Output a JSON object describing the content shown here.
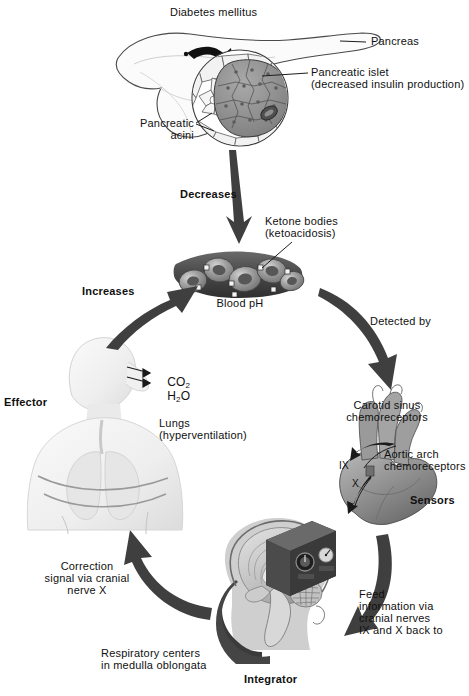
{
  "figure": {
    "background_color": "#ffffff",
    "text_color": "#101010",
    "arrow_color": "#3a3a3a"
  },
  "labels": {
    "diabetes_mellitus": "Diabetes mellitus",
    "pancreas": "Pancreas",
    "pancreatic_islet_line1": "Pancreatic islet",
    "pancreatic_islet_line2": "(decreased insulin production)",
    "pancreatic_acini_line1": "Pancreatic",
    "pancreatic_acini_line2": "acini",
    "decreases": "Decreases",
    "ketone_bodies_line1": "Ketone bodies",
    "ketone_bodies_line2": "(ketoacidosis)",
    "blood_ph": "Blood pH",
    "detected_by": "Detected by",
    "carotid_line1": "Carotid sinus",
    "carotid_line2": "chemoreceptors",
    "aortic_line1": "Aortic arch",
    "aortic_line2": "chemoreceptors",
    "sensors": "Sensors",
    "nerve_ix": "IX",
    "nerve_x": "X",
    "feed_line1": "Feed",
    "feed_line2": "information via",
    "feed_line3": "cranial nerves",
    "feed_line4": "IX and X back to",
    "integrator": "Integrator",
    "respiratory_line1": "Respiratory centers",
    "respiratory_line2": "in medulla oblongata",
    "correction_line1": "Correction",
    "correction_line2": "signal via cranial",
    "correction_line3": "nerve X",
    "increases": "Increases",
    "effector": "Effector",
    "lungs_line1": "Lungs",
    "lungs_line2": "(hyperventilation)",
    "co2_formula": "CO",
    "co2_sub": "2",
    "h2o_formula_h": "H",
    "h2o_sub": "2",
    "h2o_formula_o": "O"
  },
  "loop_steps": [
    "Diabetes mellitus / pancreatic islet with decreased insulin production",
    "Decreases blood pH (ketone bodies / ketoacidosis)",
    "Detected by carotid sinus and aortic arch chemoreceptors (Sensors)",
    "Feed information via cranial nerves IX and X back to respiratory centers in medulla oblongata (Integrator)",
    "Correction signal via cranial nerve X to lungs (Effector)",
    "Lungs hyperventilate expelling CO2 and H2O which increases blood pH"
  ]
}
